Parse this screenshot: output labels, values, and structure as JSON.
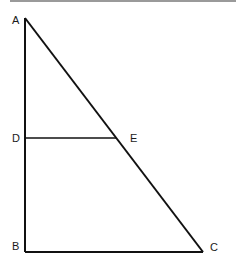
{
  "diagram": {
    "type": "geometry",
    "shape": "right triangle with segment parallel to base",
    "points": {
      "A": {
        "label": "A",
        "x": 25,
        "y": 18
      },
      "B": {
        "label": "B",
        "x": 25,
        "y": 252
      },
      "C": {
        "label": "C",
        "x": 203,
        "y": 252
      },
      "D": {
        "label": "D",
        "x": 25,
        "y": 138
      },
      "E": {
        "label": "E",
        "x": 116,
        "y": 138
      }
    },
    "segments": [
      "AB",
      "BC",
      "AC",
      "DE"
    ],
    "colors": {
      "line": "#111111",
      "text": "#1a1a1a",
      "topbar": "#9a9a9a"
    }
  }
}
